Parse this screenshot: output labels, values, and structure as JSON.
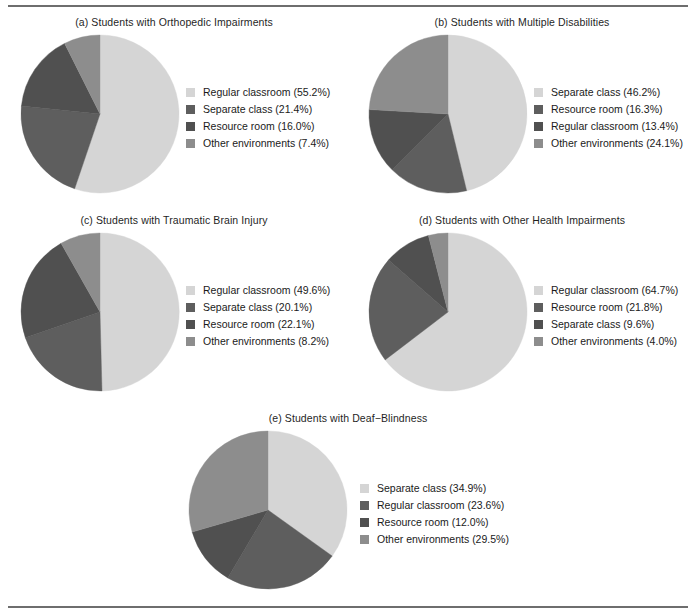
{
  "figure": {
    "background": "#ffffff",
    "rule_color": "#6e6e6e",
    "palette": {
      "lightest": "#d5d5d5",
      "dark": "#5e5e5e",
      "darkest": "#505050",
      "medium": "#8d8d8d"
    }
  },
  "chart_data": [
    {
      "type": "pie",
      "id": "a",
      "title": "(a) Students with Orthopedic Impairments",
      "labels": [
        "Regular classroom",
        "Separate class",
        "Resource room",
        "Other environments"
      ],
      "values": [
        55.2,
        21.4,
        16.0,
        7.4
      ],
      "legend_entries": [
        "Regular classroom (55.2%)",
        "Separate class (21.4%)",
        "Resource room (16.0%)",
        "Other environments (7.4%)"
      ],
      "colors": [
        "#d5d5d5",
        "#5e5e5e",
        "#505050",
        "#8d8d8d"
      ],
      "units": "percent",
      "start_angle_deg": 0,
      "direction": "clockwise",
      "legend_position": "right"
    },
    {
      "type": "pie",
      "id": "b",
      "title": "(b) Students with Multiple Disabilities",
      "labels": [
        "Separate class",
        "Resource room",
        "Regular classroom",
        "Other environments"
      ],
      "values": [
        46.2,
        16.3,
        13.4,
        24.1
      ],
      "legend_entries": [
        "Separate class (46.2%)",
        "Resource room (16.3%)",
        "Regular classroom (13.4%)",
        "Other environments (24.1%)"
      ],
      "colors": [
        "#d5d5d5",
        "#5e5e5e",
        "#505050",
        "#8d8d8d"
      ],
      "units": "percent",
      "start_angle_deg": 0,
      "direction": "clockwise",
      "legend_position": "right"
    },
    {
      "type": "pie",
      "id": "c",
      "title": "(c) Students with Traumatic Brain Injury",
      "labels": [
        "Regular classroom",
        "Separate class",
        "Resource room",
        "Other environments"
      ],
      "values": [
        49.6,
        20.1,
        22.1,
        8.2
      ],
      "legend_entries": [
        "Regular classroom (49.6%)",
        "Separate class (20.1%)",
        "Resource room (22.1%)",
        "Other environments (8.2%)"
      ],
      "colors": [
        "#d5d5d5",
        "#5e5e5e",
        "#505050",
        "#8d8d8d"
      ],
      "units": "percent",
      "start_angle_deg": 0,
      "direction": "clockwise",
      "legend_position": "right"
    },
    {
      "type": "pie",
      "id": "d",
      "title": "(d) Students with Other Health Impairments",
      "labels": [
        "Regular classroom",
        "Resource room",
        "Separate class",
        "Other environments"
      ],
      "values": [
        64.7,
        21.8,
        9.6,
        4.0
      ],
      "legend_entries": [
        "Regular classroom (64.7%)",
        "Resource room (21.8%)",
        "Separate class (9.6%)",
        "Other environments (4.0%)"
      ],
      "colors": [
        "#d5d5d5",
        "#5e5e5e",
        "#505050",
        "#8d8d8d"
      ],
      "units": "percent",
      "start_angle_deg": 0,
      "direction": "clockwise",
      "legend_position": "right"
    },
    {
      "type": "pie",
      "id": "e",
      "title": "(e) Students with Deaf−Blindness",
      "labels": [
        "Separate class",
        "Regular classroom",
        "Resource room",
        "Other environments"
      ],
      "values": [
        34.9,
        23.6,
        12.0,
        29.5
      ],
      "legend_entries": [
        "Separate class (34.9%)",
        "Regular classroom (23.6%)",
        "Resource room (12.0%)",
        "Other environments (29.5%)"
      ],
      "colors": [
        "#d5d5d5",
        "#5e5e5e",
        "#505050",
        "#8d8d8d"
      ],
      "units": "percent",
      "start_angle_deg": 0,
      "direction": "clockwise",
      "legend_position": "right"
    }
  ],
  "layout": {
    "panels": [
      {
        "id": "a",
        "left": 0,
        "top": 16,
        "width": 348,
        "pie_cx": 100,
        "pie_cy": 101,
        "pie_r": 79,
        "legend_left": 186,
        "legend_top": 68
      },
      {
        "id": "b",
        "left": 348,
        "top": 16,
        "width": 348,
        "pie_cx": 100,
        "pie_cy": 101,
        "pie_r": 79,
        "legend_left": 186,
        "legend_top": 68
      },
      {
        "id": "c",
        "left": 0,
        "top": 214,
        "width": 348,
        "pie_cx": 100,
        "pie_cy": 101,
        "pie_r": 79,
        "legend_left": 186,
        "legend_top": 68
      },
      {
        "id": "d",
        "left": 348,
        "top": 214,
        "width": 348,
        "pie_cx": 100,
        "pie_cy": 101,
        "pie_r": 79,
        "legend_left": 186,
        "legend_top": 68
      },
      {
        "id": "e",
        "left": 174,
        "top": 412,
        "width": 348,
        "pie_cx": 94,
        "pie_cy": 101,
        "pie_r": 79,
        "legend_left": 186,
        "legend_top": 68
      }
    ]
  }
}
